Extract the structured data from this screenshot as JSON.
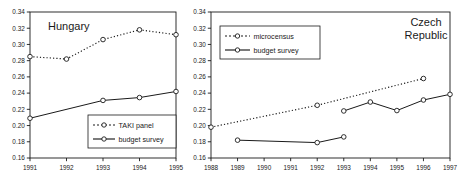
{
  "figure": {
    "panel_count": 2,
    "background": "#ffffff",
    "ink": "#1a1a1a"
  },
  "chart_data": [
    {
      "id": "hungary",
      "type": "line",
      "title": "Hungary",
      "xlabel": "",
      "ylabel": "",
      "x": [
        1991,
        1992,
        1993,
        1994,
        1995
      ],
      "xticklabels": [
        "1991",
        "1992",
        "1993",
        "1994",
        "1995"
      ],
      "ylim": [
        0.16,
        0.34
      ],
      "yticks": [
        0.16,
        0.18,
        0.2,
        0.22,
        0.24,
        0.26,
        0.28,
        0.3,
        0.32,
        0.34
      ],
      "yticklabels": [
        "0.16",
        "0.18",
        "0.20",
        "0.22",
        "0.24",
        "0.26",
        "0.28",
        "0.30",
        "0.32",
        "0.34"
      ],
      "grid": false,
      "legend_position": "lower-right",
      "series": [
        {
          "name": "TAKI panel",
          "style": "dotted",
          "marker": "open-circle",
          "x": [
            1991,
            1992,
            1993,
            1994,
            1995
          ],
          "values": [
            0.285,
            0.282,
            0.306,
            0.318,
            0.312
          ]
        },
        {
          "name": "budget survey",
          "style": "solid",
          "marker": "open-circle",
          "x": [
            1991,
            1993,
            1994,
            1995
          ],
          "values": [
            0.209,
            0.231,
            0.2345,
            0.242
          ]
        }
      ]
    },
    {
      "id": "czech-republic",
      "type": "line",
      "title": "Czech Republic",
      "title_line1": "Czech",
      "title_line2": "Republic",
      "xlabel": "",
      "ylabel": "",
      "x": [
        1988,
        1989,
        1990,
        1991,
        1992,
        1993,
        1994,
        1995,
        1996,
        1997
      ],
      "xticklabels": [
        "1988",
        "1989",
        "1990",
        "1991",
        "1992",
        "1993",
        "1994",
        "1995",
        "1996",
        "1997"
      ],
      "ylim": [
        0.16,
        0.34
      ],
      "yticks": [
        0.16,
        0.18,
        0.2,
        0.22,
        0.24,
        0.26,
        0.28,
        0.3,
        0.32,
        0.34
      ],
      "yticklabels": [
        "0.16",
        "0.18",
        "0.20",
        "0.22",
        "0.24",
        "0.26",
        "0.28",
        "0.30",
        "0.32",
        "0.34"
      ],
      "grid": false,
      "legend_position": "upper-left",
      "series": [
        {
          "name": "microcensus",
          "style": "dotted",
          "marker": "open-circle",
          "x": [
            1988,
            1992,
            1996
          ],
          "values": [
            0.198,
            0.225,
            0.258
          ]
        },
        {
          "name": "budget survey",
          "style": "solid",
          "marker": "open-circle",
          "segments": [
            {
              "x": [
                1989,
                1992,
                1993
              ],
              "values": [
                0.182,
                0.179,
                0.186
              ]
            },
            {
              "x": [
                1993,
                1994,
                1995,
                1996,
                1997
              ],
              "values": [
                0.218,
                0.229,
                0.2185,
                0.2315,
                0.2385
              ]
            }
          ]
        }
      ]
    }
  ]
}
